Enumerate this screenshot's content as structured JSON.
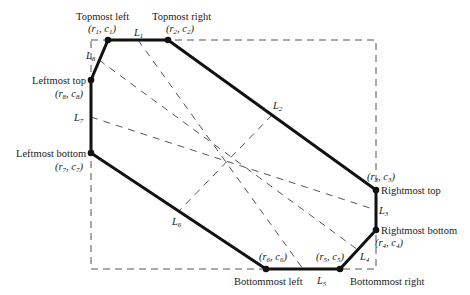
{
  "diagram": {
    "colors": {
      "outline": "#111111",
      "dashed": "#555555",
      "text": "#222222"
    },
    "bounding_box": {
      "left": 91,
      "top": 40,
      "right": 376,
      "bottom": 269
    },
    "vertices": [
      {
        "id": "p1",
        "name": "Topmost left",
        "coord": "(r1, c1)",
        "x": 108,
        "y": 40
      },
      {
        "id": "p2",
        "name": "Topmost right",
        "coord": "(r2, c2)",
        "x": 168,
        "y": 40
      },
      {
        "id": "p3",
        "name": "Rightmost top",
        "coord": "(r3, c3)",
        "x": 376,
        "y": 190
      },
      {
        "id": "p4",
        "name": "Rightmost bottom",
        "coord": "(r4, c4)",
        "x": 376,
        "y": 230
      },
      {
        "id": "p5",
        "name": "Bottommost right",
        "coord": "(r5, c5)",
        "x": 340,
        "y": 269
      },
      {
        "id": "p6",
        "name": "Bottommost left",
        "coord": "(r6, c6)",
        "x": 266,
        "y": 269
      },
      {
        "id": "p7",
        "name": "Leftmost bottom",
        "coord": "(r7, c7)",
        "x": 91,
        "y": 153
      },
      {
        "id": "p8",
        "name": "Leftmost top",
        "coord": "(r8, c8)",
        "x": 91,
        "y": 80
      }
    ],
    "labels": {
      "topmost_left": "Topmost left",
      "topmost_right": "Topmost right",
      "leftmost_top": "Leftmost top",
      "leftmost_bottom": "Leftmost bottom",
      "rightmost_top": "Rightmost top",
      "rightmost_bottom": "Rightmost bottom",
      "bottommost_left": "Bottommost left",
      "bottommost_right": "Bottommost right"
    },
    "coords": {
      "c1": {
        "r": "r",
        "rs": "1",
        "c": "c",
        "cs": "1"
      },
      "c2": {
        "r": "r",
        "rs": "2",
        "c": "c",
        "cs": "2"
      },
      "c3": {
        "r": "r",
        "rs": "3",
        "c": "c",
        "cs": "3"
      },
      "c4": {
        "r": "r",
        "rs": "4",
        "c": "c",
        "cs": "4"
      },
      "c5": {
        "r": "r",
        "rs": "5",
        "c": "c",
        "cs": "5"
      },
      "c6": {
        "r": "r",
        "rs": "6",
        "c": "c",
        "cs": "6"
      },
      "c7": {
        "r": "r",
        "rs": "7",
        "c": "c",
        "cs": "7"
      },
      "c8": {
        "r": "r",
        "rs": "8",
        "c": "c",
        "cs": "8"
      }
    },
    "segments": [
      {
        "id": "L1",
        "letter": "L",
        "sub": "1"
      },
      {
        "id": "L2",
        "letter": "L",
        "sub": "2"
      },
      {
        "id": "L3",
        "letter": "L",
        "sub": "3"
      },
      {
        "id": "L4",
        "letter": "L",
        "sub": "4"
      },
      {
        "id": "L5",
        "letter": "L",
        "sub": "5"
      },
      {
        "id": "L6",
        "letter": "L",
        "sub": "6"
      },
      {
        "id": "L7",
        "letter": "L",
        "sub": "7"
      },
      {
        "id": "L8",
        "letter": "L",
        "sub": "8"
      }
    ]
  }
}
